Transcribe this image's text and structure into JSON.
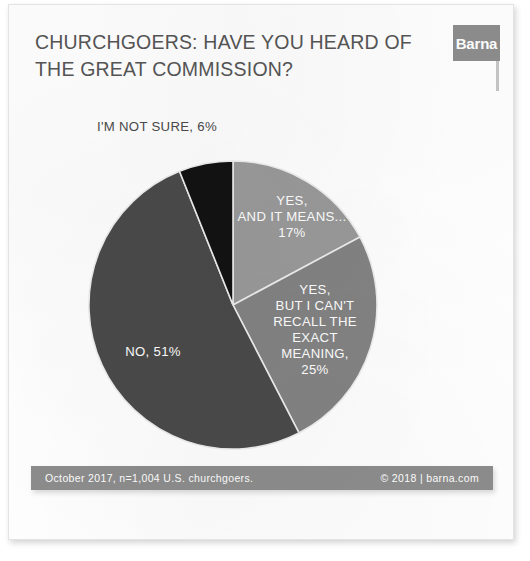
{
  "card": {
    "title_lines": [
      "CHURCHGOERS: HAVE YOU HEARD OF",
      "THE GREAT COMMISSION?"
    ],
    "logo_text": "Barna"
  },
  "footer": {
    "source": "October 2017, n=1,004 U.S. churchgoers.",
    "copyright": "© 2018 | barna.com"
  },
  "external_labels": {
    "not_sure": "I'M NOT SURE, 6%"
  },
  "colors": {
    "slice_yes_means": "#9a9a9a",
    "slice_yes_cant_recall": "#838383",
    "slice_no": "#4a4a4a",
    "slice_not_sure": "#121212",
    "title": "#565656",
    "footer_bar": "#8d8d8d",
    "logo_bar": "#8d8d8d",
    "label_text": "#ffffff",
    "separator": "#e8e8e8"
  },
  "chart_data": {
    "type": "pie",
    "title": "CHURCHGOERS: HAVE YOU HEARD OF THE GREAT COMMISSION?",
    "subtitle": "",
    "xlabel": "",
    "ylabel": "",
    "units": "percent",
    "start_angle_deg": 0,
    "direction": "clockwise",
    "legend_position": "none",
    "grid": false,
    "total": 99,
    "categories": [
      "YES, AND IT MEANS...",
      "YES, BUT I CAN'T RECALL THE EXACT MEANING,",
      "NO,",
      "I'M NOT SURE,"
    ],
    "values": [
      17,
      25,
      51,
      6
    ],
    "slices": [
      {
        "name": "YES, AND IT MEANS...",
        "value": 17,
        "label_lines": [
          "YES,",
          "AND IT MEANS...",
          "17%"
        ],
        "color": "#9a9a9a",
        "label_placement": "inside"
      },
      {
        "name": "YES, BUT I CAN'T RECALL THE EXACT MEANING,",
        "value": 25,
        "label_lines": [
          "YES,",
          "BUT I CAN'T",
          "RECALL THE",
          "EXACT",
          "MEANING,",
          "25%"
        ],
        "color": "#838383",
        "label_placement": "inside"
      },
      {
        "name": "NO,",
        "value": 51,
        "label_lines": [
          "NO, 51%"
        ],
        "color": "#4a4a4a",
        "label_placement": "inside"
      },
      {
        "name": "I'M NOT SURE,",
        "value": 6,
        "label_lines": [
          "I'M NOT SURE, 6%"
        ],
        "color": "#121212",
        "label_placement": "outside-top-left"
      }
    ],
    "source_note": "October 2017, n=1,004 U.S. churchgoers.",
    "attribution": "© 2018 | barna.com"
  }
}
